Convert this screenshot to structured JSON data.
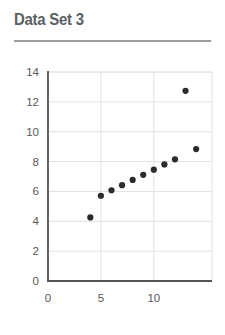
{
  "card": {
    "title": "Data Set 3"
  },
  "chart_data": {
    "type": "scatter",
    "title": "Data Set 3",
    "xlabel": "",
    "ylabel": "",
    "xlim": [
      0,
      15.5
    ],
    "ylim": [
      0,
      14
    ],
    "xticks": [
      0,
      5,
      10
    ],
    "yticks": [
      0,
      2,
      4,
      6,
      8,
      10,
      12,
      14
    ],
    "xtick_labels": [
      "0",
      "5",
      "10"
    ],
    "ytick_labels": [
      "0",
      "2",
      "4",
      "6",
      "8",
      "10",
      "12",
      "14"
    ],
    "grid": true,
    "legend": false,
    "marker": "circle",
    "marker_color": "#2b2b2b",
    "marker_size": 3.1,
    "series": [
      {
        "name": "Data Set 3",
        "x": [
          4,
          5,
          6,
          7,
          8,
          9,
          10,
          11,
          12,
          13,
          14
        ],
        "y": [
          4.26,
          5.71,
          6.08,
          6.42,
          6.77,
          7.11,
          7.46,
          7.81,
          8.15,
          12.74,
          8.84
        ]
      }
    ]
  },
  "colors": {
    "title_text": "#5b5f63",
    "rule": "#9a9da0",
    "axis": "#555555",
    "grid": "#e2e2e2",
    "marker": "#2b2b2b",
    "background": "#ffffff"
  }
}
